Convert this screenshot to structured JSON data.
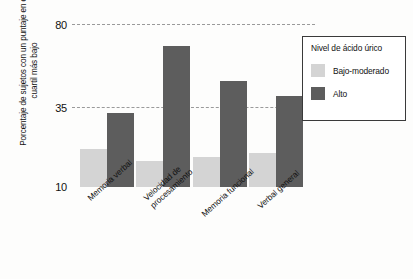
{
  "chart_data": {
    "type": "bar",
    "title": "",
    "xlabel": "",
    "ylabel": "Porcentaje de sujetos con un puntaje en el cuartil más bajo",
    "categories": [
      "Memoria verbal",
      "Velocidad de procesamiento",
      "Memoria funcional",
      "Verbal general"
    ],
    "category_lines": [
      [
        "Memoria verbal"
      ],
      [
        "Velocidad de",
        "procesamiento"
      ],
      [
        "Memoria funcional"
      ],
      [
        "Verbal general"
      ]
    ],
    "series": [
      {
        "name": "Bajo-moderado",
        "color": "#d4d4d4",
        "values": [
          22,
          18,
          19.5,
          20.5
        ]
      },
      {
        "name": "Alto",
        "color": "#5d5d5d",
        "values": [
          33,
          68,
          49,
          41
        ]
      }
    ],
    "yticks": [
      80,
      35,
      10
    ],
    "ylim": [
      10,
      80
    ],
    "grid": "horizontal-dashed",
    "legend_position": "top-right",
    "legend_title": "Nivel de ácido úrico"
  },
  "legend": {
    "title": "Nivel de ácido úrico",
    "entries": [
      {
        "label": "Bajo-moderado",
        "color": "#d4d4d4"
      },
      {
        "label": "Alto",
        "color": "#5d5d5d"
      }
    ]
  },
  "axes": {
    "y_title": "Porcentaje de sujetos con un puntaje en el cuartil más bajo",
    "y_tick_80": "80",
    "y_tick_35": "35",
    "y_tick_10": "10"
  }
}
